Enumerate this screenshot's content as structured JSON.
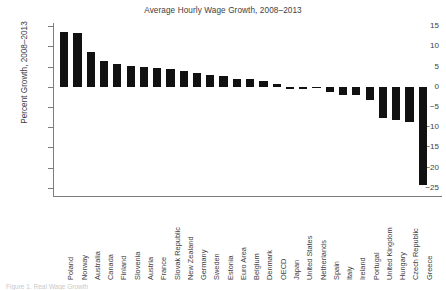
{
  "figure": {
    "title": "Average Hourly Wage Growth, 2008–2013",
    "caption_remnant": "Figure 1.  Real Wage Growth"
  },
  "chart_data": {
    "type": "bar",
    "title": "Average Hourly Wage Growth, 2008–2013",
    "xlabel": "",
    "ylabel": "Percent Growth, 2008–2013",
    "ylim": [
      -27,
      16
    ],
    "ytick_values": [
      15,
      10,
      5,
      0,
      -5,
      -10,
      -15,
      -20,
      -25
    ],
    "ytick_labels": [
      "15",
      "10",
      "5",
      "0",
      "−5",
      "−10",
      "−15",
      "−20",
      "−25"
    ],
    "grid": false,
    "legend": null,
    "bar_color": "#111111",
    "orientation": "vertical",
    "sorted": "descending",
    "categories": [
      "Poland",
      "Norway",
      "Australia",
      "Canada",
      "Finland",
      "Slovenia",
      "Austria",
      "France",
      "Slovak Republic",
      "New Zealand",
      "Germany",
      "Sweden",
      "Estonia",
      "Euro Area",
      "Belgium",
      "Denmark",
      "OECD",
      "Japan",
      "United States",
      "Netherlands",
      "Spain",
      "Italy",
      "Ireland",
      "Portugal",
      "United Kingdom",
      "Hungary",
      "Czech Republic",
      "Greece"
    ],
    "values": [
      13.5,
      13.2,
      8.7,
      6.4,
      5.5,
      5.2,
      4.9,
      4.6,
      4.3,
      3.9,
      3.5,
      2.9,
      2.7,
      2.0,
      1.8,
      1.4,
      0.7,
      -0.5,
      -0.5,
      -0.2,
      -1.3,
      -2.0,
      -2.0,
      -3.2,
      -7.8,
      -8.2,
      -8.8,
      -24.2
    ]
  }
}
